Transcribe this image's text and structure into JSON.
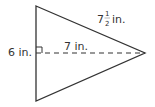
{
  "diagram": {
    "shape": "triangle",
    "labels": {
      "base": "6 in.",
      "height": "7 in.",
      "slant_whole": "7",
      "slant_num": "1",
      "slant_den": "2",
      "slant_unit": "in."
    },
    "colors": {
      "stroke": "#333333",
      "text": "#333333"
    }
  }
}
